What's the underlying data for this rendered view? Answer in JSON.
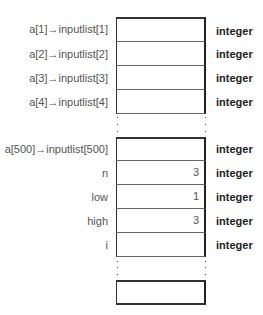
{
  "diagram": {
    "type": "memory-layout",
    "group1": {
      "rows": [
        {
          "label": "a[1]→inputlist[1]",
          "value": "",
          "type": "integer"
        },
        {
          "label": "a[2]→inputlist[2]",
          "value": "",
          "type": "integer"
        },
        {
          "label": "a[3]→inputlist[3]",
          "value": "",
          "type": "integer"
        },
        {
          "label": "a[4]→inputlist[4]",
          "value": "",
          "type": "integer"
        }
      ]
    },
    "group2": {
      "rows": [
        {
          "label": "a[500]→inputlist[500]",
          "value": "",
          "type": "integer"
        },
        {
          "label": "n",
          "value": "3",
          "type": "integer"
        },
        {
          "label": "low",
          "value": "1",
          "type": "integer"
        },
        {
          "label": "high",
          "value": "3",
          "type": "integer"
        },
        {
          "label": "i",
          "value": "",
          "type": "integer"
        }
      ]
    },
    "group3": {
      "rows": [
        {
          "label": "",
          "value": "",
          "type": ""
        }
      ]
    },
    "ellipsis": "⋮"
  }
}
